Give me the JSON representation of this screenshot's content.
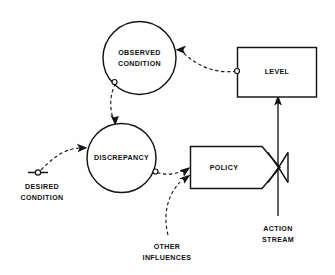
{
  "diagram": {
    "background_color": "#fefefe",
    "line_color": "#141414",
    "nodes": {
      "observed_condition": {
        "label_line1": "OBSERVED",
        "label_line2": "CONDITION",
        "shape": "circle"
      },
      "discrepancy": {
        "label_line1": "DISCREPANCY",
        "shape": "circle"
      },
      "level": {
        "label_line1": "LEVEL",
        "shape": "rectangle"
      },
      "policy": {
        "label_line1": "POLICY",
        "shape": "pentagon-valve"
      },
      "desired_condition": {
        "label_line1": "DESIRED",
        "label_line2": "CONDITION",
        "shape": "source-constant"
      },
      "other_influences": {
        "label_line1": "OTHER",
        "label_line2": "INFLUENCES",
        "shape": "text-source"
      },
      "action_stream": {
        "label_line1": "ACTION",
        "label_line2": "STREAM",
        "shape": "flow-arrow"
      }
    },
    "links": [
      {
        "name": "level-to-observed-condition",
        "from": "level",
        "to": "observed_condition",
        "style": "dashed-information-link"
      },
      {
        "name": "observed-condition-to-discrepancy",
        "from": "observed_condition",
        "to": "discrepancy",
        "style": "dashed-information-link"
      },
      {
        "name": "desired-condition-to-discrepancy",
        "from": "desired_condition",
        "to": "discrepancy",
        "style": "dashed-information-link"
      },
      {
        "name": "discrepancy-to-policy",
        "from": "discrepancy",
        "to": "policy",
        "style": "dashed-information-link"
      },
      {
        "name": "other-influences-to-policy",
        "from": "other_influences",
        "to": "policy",
        "style": "dashed-information-link"
      },
      {
        "name": "action-stream-to-level",
        "from": "policy",
        "to": "level",
        "style": "solid-flow-arrow"
      }
    ]
  }
}
